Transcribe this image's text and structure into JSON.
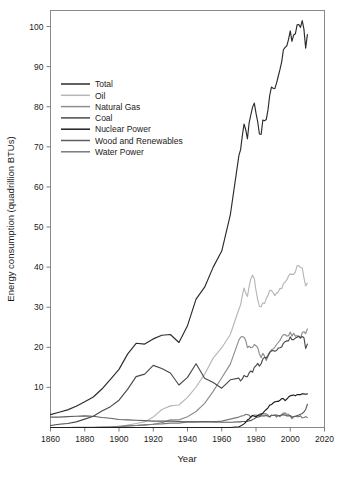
{
  "chart_data": {
    "type": "line",
    "title": "",
    "xlabel": "Year",
    "ylabel": "Energy consumption (quadrillion BTUs)",
    "xlim": [
      1860,
      2020
    ],
    "ylim": [
      0,
      104
    ],
    "xticks": [
      1860,
      1880,
      1900,
      1920,
      1940,
      1960,
      1980,
      2000,
      2020
    ],
    "yticks": [
      10,
      20,
      30,
      40,
      50,
      60,
      70,
      80,
      90,
      100
    ],
    "grid": false,
    "legend_position": "upper-left",
    "x": [
      1860,
      1865,
      1870,
      1875,
      1880,
      1885,
      1890,
      1895,
      1900,
      1905,
      1910,
      1915,
      1920,
      1925,
      1930,
      1935,
      1940,
      1945,
      1950,
      1955,
      1960,
      1965,
      1970,
      1971,
      1972,
      1973,
      1974,
      1975,
      1976,
      1977,
      1978,
      1979,
      1980,
      1981,
      1982,
      1983,
      1984,
      1985,
      1986,
      1987,
      1988,
      1989,
      1990,
      1991,
      1992,
      1993,
      1994,
      1995,
      1996,
      1997,
      1998,
      1999,
      2000,
      2001,
      2002,
      2003,
      2004,
      2005,
      2006,
      2007,
      2008,
      2009,
      2010
    ],
    "series": [
      {
        "name": "Total",
        "color": "#2b2b2b",
        "values": [
          3.2,
          3.8,
          4.4,
          5.3,
          6.4,
          7.6,
          9.6,
          12.0,
          14.5,
          18.3,
          21.0,
          20.8,
          22.1,
          23.0,
          23.2,
          21.2,
          25.4,
          32.0,
          35.0,
          40.0,
          44.0,
          53.0,
          67.8,
          69.3,
          72.7,
          75.7,
          74.3,
          72.0,
          76.0,
          78.0,
          79.9,
          80.9,
          78.4,
          76.2,
          73.2,
          73.1,
          76.7,
          76.5,
          76.8,
          79.2,
          82.8,
          84.9,
          84.6,
          84.5,
          85.9,
          87.6,
          89.3,
          91.2,
          94.2,
          94.8,
          95.2,
          96.8,
          98.9,
          96.3,
          97.9,
          98.2,
          100.4,
          100.5,
          99.8,
          101.5,
          99.3,
          94.6,
          98.0
        ]
      },
      {
        "name": "Oil",
        "color": "#b7b7b7",
        "values": [
          0.0,
          0.0,
          0.0,
          0.1,
          0.1,
          0.1,
          0.2,
          0.2,
          0.2,
          0.6,
          1.0,
          1.4,
          2.6,
          4.5,
          5.4,
          5.6,
          7.5,
          10.1,
          13.3,
          17.3,
          19.9,
          23.2,
          29.5,
          30.6,
          32.9,
          34.8,
          33.5,
          32.7,
          35.2,
          37.1,
          38.0,
          37.1,
          34.2,
          31.9,
          30.2,
          30.1,
          31.1,
          30.9,
          32.2,
          32.9,
          34.2,
          34.2,
          33.6,
          32.9,
          33.5,
          33.8,
          34.7,
          34.6,
          35.8,
          36.3,
          36.8,
          37.8,
          38.3,
          38.2,
          38.2,
          38.8,
          40.3,
          40.4,
          39.9,
          39.8,
          37.3,
          35.3,
          36.0
        ]
      },
      {
        "name": "Natural Gas",
        "color": "#8d8d8d",
        "values": [
          0.0,
          0.0,
          0.0,
          0.0,
          0.0,
          0.0,
          0.1,
          0.1,
          0.1,
          0.4,
          0.5,
          0.7,
          0.8,
          1.2,
          1.9,
          1.9,
          2.7,
          4.0,
          6.0,
          9.0,
          12.4,
          15.8,
          21.8,
          22.5,
          22.7,
          22.5,
          21.7,
          19.9,
          20.3,
          19.9,
          20.0,
          20.7,
          20.4,
          19.9,
          18.4,
          17.4,
          18.5,
          17.8,
          16.7,
          17.7,
          18.6,
          19.4,
          19.6,
          20.0,
          20.7,
          21.2,
          21.7,
          22.6,
          23.1,
          23.2,
          22.8,
          22.9,
          23.8,
          22.8,
          23.5,
          22.8,
          22.9,
          22.6,
          22.2,
          23.7,
          23.9,
          23.4,
          24.6
        ]
      },
      {
        "name": "Coal",
        "color": "#4a4a4a",
        "values": [
          0.5,
          0.8,
          1.0,
          1.4,
          2.1,
          2.8,
          4.1,
          5.2,
          6.8,
          9.5,
          12.7,
          13.3,
          15.5,
          14.7,
          13.6,
          10.6,
          12.5,
          15.9,
          12.3,
          11.2,
          9.8,
          11.9,
          12.3,
          11.6,
          12.1,
          13.0,
          12.7,
          12.7,
          13.6,
          14.1,
          13.8,
          15.0,
          15.4,
          16.0,
          15.3,
          15.9,
          17.1,
          17.5,
          17.3,
          18.0,
          18.8,
          19.1,
          19.2,
          19.0,
          19.2,
          19.8,
          19.9,
          20.1,
          21.0,
          21.4,
          21.6,
          21.6,
          22.6,
          21.9,
          21.9,
          22.3,
          22.5,
          22.8,
          22.4,
          22.7,
          22.4,
          19.7,
          20.8
        ]
      },
      {
        "name": "Nuclear Power",
        "color": "#1f1f1f",
        "values": [
          0.0,
          0.0,
          0.0,
          0.0,
          0.0,
          0.0,
          0.0,
          0.0,
          0.0,
          0.0,
          0.0,
          0.0,
          0.0,
          0.0,
          0.0,
          0.0,
          0.0,
          0.0,
          0.0,
          0.0,
          0.0,
          0.0,
          0.2,
          0.4,
          0.6,
          0.9,
          1.3,
          1.9,
          2.1,
          2.7,
          3.0,
          2.8,
          2.7,
          3.0,
          3.1,
          3.2,
          3.6,
          4.1,
          4.5,
          4.9,
          5.6,
          5.7,
          6.1,
          6.4,
          6.5,
          6.5,
          6.8,
          7.2,
          7.2,
          6.7,
          7.1,
          7.6,
          7.9,
          8.0,
          8.1,
          7.9,
          8.2,
          8.2,
          8.2,
          8.4,
          8.4,
          8.3,
          8.4
        ]
      },
      {
        "name": "Wood and Renewables",
        "color": "#5e5e5e",
        "values": [
          2.6,
          2.6,
          2.7,
          2.8,
          2.9,
          2.8,
          2.5,
          2.3,
          2.0,
          1.9,
          1.8,
          1.7,
          1.6,
          1.6,
          1.6,
          1.5,
          1.4,
          1.4,
          1.5,
          1.4,
          1.3,
          1.3,
          1.4,
          1.4,
          1.5,
          1.5,
          1.5,
          1.5,
          1.7,
          1.7,
          2.0,
          2.2,
          2.5,
          2.6,
          2.7,
          2.9,
          2.9,
          2.9,
          3.0,
          2.8,
          2.7,
          3.1,
          3.0,
          3.1,
          3.1,
          3.0,
          3.0,
          3.1,
          3.2,
          3.1,
          2.9,
          2.9,
          3.0,
          2.6,
          2.7,
          2.8,
          3.0,
          3.1,
          3.3,
          3.5,
          3.9,
          4.5,
          5.8
        ]
      },
      {
        "name": "Water Power",
        "color": "#7a7a7a",
        "values": [
          0.0,
          0.0,
          0.0,
          0.0,
          0.0,
          0.0,
          0.0,
          0.1,
          0.3,
          0.4,
          0.5,
          0.6,
          0.8,
          0.9,
          1.1,
          1.1,
          1.4,
          1.4,
          1.4,
          1.4,
          1.6,
          2.1,
          2.6,
          2.8,
          2.9,
          3.0,
          3.3,
          3.2,
          3.1,
          2.5,
          3.0,
          3.1,
          3.1,
          3.0,
          3.3,
          3.5,
          3.4,
          3.4,
          3.4,
          3.1,
          2.6,
          3.0,
          3.0,
          3.1,
          2.6,
          3.0,
          2.7,
          3.2,
          3.6,
          3.6,
          3.3,
          3.3,
          2.8,
          2.2,
          2.7,
          2.8,
          2.7,
          2.7,
          2.9,
          2.4,
          2.5,
          2.7,
          2.5
        ]
      }
    ]
  },
  "axes": {
    "x_title": "Year",
    "y_title": "Energy consumption (quadrillion BTUs)",
    "x_tick_labels": [
      "1860",
      "1880",
      "1900",
      "1920",
      "1940",
      "1960",
      "1980",
      "2000",
      "2020"
    ],
    "y_tick_labels": [
      "10",
      "20",
      "30",
      "40",
      "50",
      "60",
      "70",
      "80",
      "90",
      "100"
    ]
  },
  "legend": {
    "items": [
      {
        "label": "Total",
        "color": "#2b2b2b"
      },
      {
        "label": "Oil",
        "color": "#b7b7b7"
      },
      {
        "label": "Natural Gas",
        "color": "#8d8d8d"
      },
      {
        "label": "Coal",
        "color": "#4a4a4a"
      },
      {
        "label": "Nuclear Power",
        "color": "#1f1f1f"
      },
      {
        "label": "Wood and Renewables",
        "color": "#5e5e5e"
      },
      {
        "label": "Water Power",
        "color": "#7a7a7a"
      }
    ]
  },
  "style": {
    "frame_color": "#8a8a8a",
    "text_color": "#1a1a1a",
    "background": "#ffffff"
  }
}
